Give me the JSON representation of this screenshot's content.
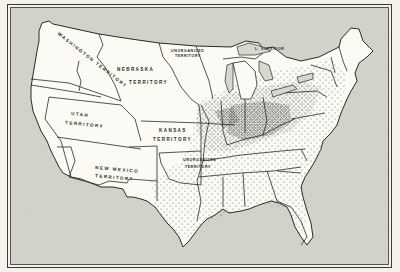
{
  "map": {
    "title": "",
    "colors": {
      "paper": "#f4f2ea",
      "sea": "#d9d8cf",
      "land": "#fbfaf4",
      "outline": "#2a2a26",
      "dots": "#2a2a26"
    },
    "labels": {
      "washington": "Washington Territory",
      "nebraska_1": "Nebraska",
      "nebraska_2": "Territory",
      "unorganized_north_1": "Unorganized",
      "unorganized_north_2": "Territory",
      "utah_1": "Utah",
      "utah_2": "Territory",
      "kansas_1": "Kansas",
      "kansas_2": "Territory",
      "new_mexico_1": "New Mexico",
      "new_mexico_2": "Territory",
      "unorganized_south_1": "Unorganized",
      "unorganized_south_2": "Territory",
      "lake_superior": "L. Superior"
    },
    "legend": "Dot density indicates population distribution in the eastern states"
  }
}
